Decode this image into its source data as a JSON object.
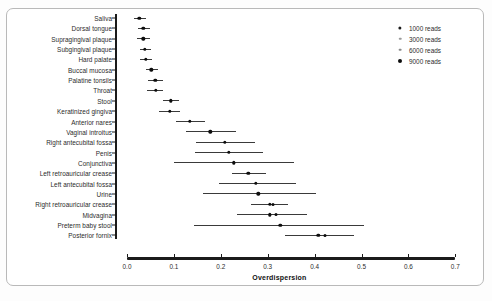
{
  "figure": {
    "title": "",
    "x_label": "Overdispersion",
    "caption": ""
  },
  "legend": {
    "title": "",
    "entries": [
      {
        "label": "1000 reads",
        "size": 2.6,
        "color": "#1a1a1a"
      },
      {
        "label": "3000 reads",
        "size": 2.0,
        "color": "#9a9a9a"
      },
      {
        "label": "6000 reads",
        "size": 2.2,
        "color": "#8a8a8a"
      },
      {
        "label": "9000 reads",
        "size": 3.2,
        "color": "#0d0d0d"
      }
    ]
  },
  "chart_data": {
    "type": "scatter",
    "title": "",
    "xlabel": "Overdispersion",
    "ylabel": "",
    "xlim": [
      0.0,
      0.7
    ],
    "xticks": [
      "0.0",
      "0.1",
      "0.2",
      "0.3",
      "0.4",
      "0.5",
      "0.6",
      "0.7"
    ],
    "xtick_values": [
      0.0,
      0.1,
      0.2,
      0.3,
      0.4,
      0.5,
      0.6,
      0.7
    ],
    "grid": false,
    "legend_position": "top-right",
    "orientation": "horizontal",
    "categories": [
      "Saliva",
      "Dorsal tongue",
      "Supragingival plaque",
      "Subgingival plaque",
      "Hard palate",
      "Buccal mucosa",
      "Palatine tonsils",
      "Throat",
      "Stool",
      "Keratinized gingiva",
      "Anterior nares",
      "Vaginal introitus",
      "Right antecubital fossa",
      "Penis",
      "Conjunctiva",
      "Left retroauricular crease",
      "Left antecubital fossa",
      "Urine",
      "Right retroauricular crease",
      "Midvagina",
      "Preterm baby stool",
      "Posterior fornix"
    ],
    "points": [
      {
        "category": "Saliva",
        "value": 0.026,
        "low": 0.014,
        "high": 0.04,
        "extra": null
      },
      {
        "category": "Dorsal tongue",
        "value": 0.035,
        "low": 0.024,
        "high": 0.048,
        "extra": null
      },
      {
        "category": "Supragingival plaque",
        "value": 0.035,
        "low": 0.022,
        "high": 0.05,
        "extra": null
      },
      {
        "category": "Subgingival plaque",
        "value": 0.038,
        "low": 0.027,
        "high": 0.051,
        "extra": null
      },
      {
        "category": "Hard palate",
        "value": 0.04,
        "low": 0.028,
        "high": 0.053,
        "extra": null
      },
      {
        "category": "Buccal mucosa",
        "value": 0.052,
        "low": 0.04,
        "high": 0.066,
        "extra": null
      },
      {
        "category": "Palatine tonsils",
        "value": 0.06,
        "low": 0.044,
        "high": 0.076,
        "extra": null
      },
      {
        "category": "Throat",
        "value": 0.062,
        "low": 0.042,
        "high": 0.077,
        "extra": null
      },
      {
        "category": "Stool",
        "value": 0.093,
        "low": 0.076,
        "high": 0.11,
        "extra": null
      },
      {
        "category": "Keratinized gingiva",
        "value": 0.091,
        "low": 0.068,
        "high": 0.112,
        "extra": null
      },
      {
        "category": "Anterior nares",
        "value": 0.134,
        "low": 0.104,
        "high": 0.166,
        "extra": null
      },
      {
        "category": "Vaginal introitus",
        "value": 0.178,
        "low": 0.126,
        "high": 0.232,
        "extra": null
      },
      {
        "category": "Right antecubital fossa",
        "value": 0.209,
        "low": 0.147,
        "high": 0.272,
        "extra": null
      },
      {
        "category": "Penis",
        "value": 0.217,
        "low": 0.146,
        "high": 0.29,
        "extra": null
      },
      {
        "category": "Conjunctiva",
        "value": 0.228,
        "low": 0.1,
        "high": 0.356,
        "extra": null
      },
      {
        "category": "Left retroauricular crease",
        "value": 0.259,
        "low": 0.224,
        "high": 0.297,
        "extra": null
      },
      {
        "category": "Left antecubital fossa",
        "value": 0.274,
        "low": 0.196,
        "high": 0.36,
        "extra": null
      },
      {
        "category": "Urine",
        "value": 0.28,
        "low": 0.163,
        "high": 0.402,
        "extra": null
      },
      {
        "category": "Right retroauricular crease",
        "value": 0.304,
        "low": 0.265,
        "high": 0.344,
        "extra": 0.312
      },
      {
        "category": "Midvagina",
        "value": 0.304,
        "low": 0.235,
        "high": 0.383,
        "extra": 0.318
      },
      {
        "category": "Preterm baby stool",
        "value": 0.327,
        "low": 0.143,
        "high": 0.506,
        "extra": null
      },
      {
        "category": "Posterior fornix",
        "value": 0.408,
        "low": 0.336,
        "high": 0.484,
        "extra": 0.423
      }
    ]
  },
  "colors": {
    "axis": "#1b1b1b",
    "point": "#0d0d0d",
    "whisker": "#3a3a3a",
    "text": "#2b2b2b",
    "frame": "#b9b9b9",
    "background": "#ffffff"
  }
}
